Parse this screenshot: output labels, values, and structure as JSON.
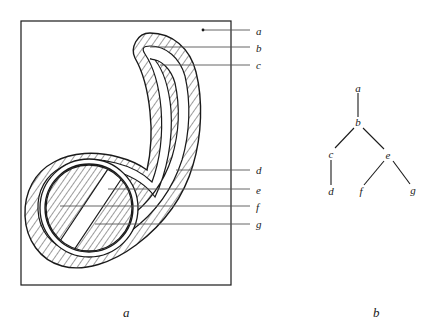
{
  "figure": {
    "panel_a": {
      "caption": "a",
      "frame": {
        "x": 21,
        "y": 21,
        "width": 210,
        "height": 264,
        "stroke": "#1a1a1a"
      },
      "callout_labels": [
        {
          "id": "a",
          "text": "a",
          "label_x": 256,
          "label_y": 26,
          "line_y": 30,
          "line_x1": 203,
          "line_x2": 250,
          "has_dot": true,
          "dot_x": 203,
          "dot_y": 30
        },
        {
          "id": "b",
          "text": "b",
          "label_x": 256,
          "label_y": 43,
          "line_y": 47,
          "line_x1": 150,
          "line_x2": 250,
          "has_dot": false
        },
        {
          "id": "c",
          "text": "c",
          "label_x": 256,
          "label_y": 60,
          "line_y": 65,
          "line_x1": 160,
          "line_x2": 250,
          "has_dot": false
        },
        {
          "id": "d",
          "text": "d",
          "label_x": 256,
          "label_y": 165,
          "line_y": 170,
          "line_x1": 176,
          "line_x2": 250,
          "has_dot": false
        },
        {
          "id": "e",
          "text": "e",
          "label_x": 256,
          "label_y": 185,
          "line_y": 189,
          "line_x1": 108,
          "line_x2": 250,
          "has_dot": false
        },
        {
          "id": "f",
          "text": "f",
          "label_x": 256,
          "label_y": 202,
          "line_y": 206,
          "line_x1": 60,
          "line_x2": 250,
          "has_dot": false
        },
        {
          "id": "g",
          "text": "g",
          "label_x": 256,
          "label_y": 219,
          "line_y": 224,
          "line_x1": 95,
          "line_x2": 250,
          "has_dot": false
        }
      ],
      "description": "Hatched hook-shaped nested regions with inner ring and circular core inside a rectangular frame"
    },
    "panel_b": {
      "caption": "b",
      "tree": {
        "nodes": [
          {
            "id": "a",
            "text": "a",
            "x": 358,
            "y": 88
          },
          {
            "id": "b",
            "text": "b",
            "x": 358,
            "y": 122
          },
          {
            "id": "c",
            "text": "c",
            "x": 331,
            "y": 154
          },
          {
            "id": "e",
            "text": "e",
            "x": 388,
            "y": 155
          },
          {
            "id": "d",
            "text": "d",
            "x": 331,
            "y": 191
          },
          {
            "id": "f",
            "text": "f",
            "x": 361,
            "y": 191
          },
          {
            "id": "g",
            "text": "g",
            "x": 413,
            "y": 190
          }
        ],
        "edges": [
          {
            "from": "a",
            "to": "b"
          },
          {
            "from": "b",
            "to": "c"
          },
          {
            "from": "b",
            "to": "e"
          },
          {
            "from": "c",
            "to": "d"
          },
          {
            "from": "e",
            "to": "f"
          },
          {
            "from": "e",
            "to": "g"
          }
        ]
      }
    },
    "captions": [
      {
        "id": "a",
        "text": "a",
        "x": 123,
        "y": 306
      },
      {
        "id": "b",
        "text": "b",
        "x": 373,
        "y": 306
      }
    ],
    "colors": {
      "ink": "#1a1a1a",
      "leader": "#555555",
      "hatch": "#222222",
      "background": "#ffffff"
    }
  }
}
